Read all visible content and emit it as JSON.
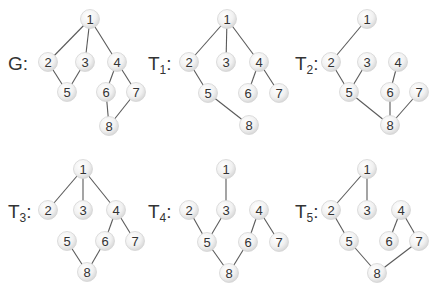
{
  "figure": {
    "width": 439,
    "height": 296,
    "node_radius": 9.5,
    "colors": {
      "edge": "#5a5a5a",
      "node_fill_center": "#ffffff",
      "node_fill_edge": "#d9d9d9",
      "text": "#333333"
    },
    "graphs": [
      {
        "id": "G",
        "label": "G",
        "subscript": "",
        "label_pos": [
          8,
          70
        ],
        "nodes": [
          {
            "id": "1",
            "x": 90,
            "y": 19
          },
          {
            "id": "2",
            "x": 48,
            "y": 62
          },
          {
            "id": "3",
            "x": 85,
            "y": 62
          },
          {
            "id": "4",
            "x": 117,
            "y": 62
          },
          {
            "id": "5",
            "x": 67,
            "y": 92
          },
          {
            "id": "6",
            "x": 106,
            "y": 92
          },
          {
            "id": "7",
            "x": 136,
            "y": 92
          },
          {
            "id": "8",
            "x": 109,
            "y": 126
          }
        ],
        "edges": [
          [
            "1",
            "2"
          ],
          [
            "1",
            "3"
          ],
          [
            "1",
            "4"
          ],
          [
            "2",
            "5"
          ],
          [
            "3",
            "5"
          ],
          [
            "4",
            "6"
          ],
          [
            "4",
            "7"
          ],
          [
            "6",
            "8"
          ],
          [
            "7",
            "8"
          ]
        ]
      },
      {
        "id": "T1",
        "label": "T",
        "subscript": "1",
        "label_pos": [
          148,
          70
        ],
        "nodes": [
          {
            "id": "1",
            "x": 227,
            "y": 19
          },
          {
            "id": "2",
            "x": 189,
            "y": 62
          },
          {
            "id": "3",
            "x": 226,
            "y": 62
          },
          {
            "id": "4",
            "x": 259,
            "y": 62
          },
          {
            "id": "5",
            "x": 208,
            "y": 93
          },
          {
            "id": "6",
            "x": 248,
            "y": 93
          },
          {
            "id": "7",
            "x": 279,
            "y": 93
          },
          {
            "id": "8",
            "x": 249,
            "y": 125
          }
        ],
        "edges": [
          [
            "1",
            "2"
          ],
          [
            "1",
            "3"
          ],
          [
            "1",
            "4"
          ],
          [
            "2",
            "5"
          ],
          [
            "4",
            "6"
          ],
          [
            "4",
            "7"
          ],
          [
            "5",
            "8"
          ]
        ]
      },
      {
        "id": "T2",
        "label": "T",
        "subscript": "2",
        "label_pos": [
          295,
          70
        ],
        "nodes": [
          {
            "id": "1",
            "x": 367,
            "y": 19
          },
          {
            "id": "2",
            "x": 331,
            "y": 62
          },
          {
            "id": "3",
            "x": 367,
            "y": 62
          },
          {
            "id": "4",
            "x": 398,
            "y": 62
          },
          {
            "id": "5",
            "x": 349,
            "y": 92
          },
          {
            "id": "6",
            "x": 390,
            "y": 92
          },
          {
            "id": "7",
            "x": 419,
            "y": 92
          },
          {
            "id": "8",
            "x": 390,
            "y": 125
          }
        ],
        "edges": [
          [
            "1",
            "2"
          ],
          [
            "2",
            "5"
          ],
          [
            "3",
            "5"
          ],
          [
            "4",
            "6"
          ],
          [
            "5",
            "8"
          ],
          [
            "6",
            "8"
          ],
          [
            "7",
            "8"
          ]
        ]
      },
      {
        "id": "T3",
        "label": "T",
        "subscript": "3",
        "label_pos": [
          8,
          218
        ],
        "nodes": [
          {
            "id": "1",
            "x": 83,
            "y": 169
          },
          {
            "id": "2",
            "x": 48,
            "y": 210
          },
          {
            "id": "3",
            "x": 83,
            "y": 210
          },
          {
            "id": "4",
            "x": 116,
            "y": 210
          },
          {
            "id": "5",
            "x": 67,
            "y": 241
          },
          {
            "id": "6",
            "x": 105,
            "y": 241
          },
          {
            "id": "7",
            "x": 135,
            "y": 241
          },
          {
            "id": "8",
            "x": 87,
            "y": 272
          }
        ],
        "edges": [
          [
            "1",
            "2"
          ],
          [
            "1",
            "3"
          ],
          [
            "1",
            "4"
          ],
          [
            "4",
            "6"
          ],
          [
            "4",
            "7"
          ],
          [
            "5",
            "8"
          ],
          [
            "6",
            "8"
          ]
        ]
      },
      {
        "id": "T4",
        "label": "T",
        "subscript": "4",
        "label_pos": [
          148,
          218
        ],
        "nodes": [
          {
            "id": "1",
            "x": 226,
            "y": 169
          },
          {
            "id": "2",
            "x": 189,
            "y": 210
          },
          {
            "id": "3",
            "x": 226,
            "y": 210
          },
          {
            "id": "4",
            "x": 259,
            "y": 210
          },
          {
            "id": "5",
            "x": 207,
            "y": 242
          },
          {
            "id": "6",
            "x": 248,
            "y": 242
          },
          {
            "id": "7",
            "x": 279,
            "y": 242
          },
          {
            "id": "8",
            "x": 229,
            "y": 273
          }
        ],
        "edges": [
          [
            "1",
            "3"
          ],
          [
            "2",
            "5"
          ],
          [
            "3",
            "5"
          ],
          [
            "4",
            "6"
          ],
          [
            "4",
            "7"
          ],
          [
            "5",
            "8"
          ],
          [
            "6",
            "8"
          ]
        ]
      },
      {
        "id": "T5",
        "label": "T",
        "subscript": "5",
        "label_pos": [
          295,
          218
        ],
        "nodes": [
          {
            "id": "1",
            "x": 367,
            "y": 169
          },
          {
            "id": "2",
            "x": 331,
            "y": 210
          },
          {
            "id": "3",
            "x": 367,
            "y": 210
          },
          {
            "id": "4",
            "x": 401,
            "y": 210
          },
          {
            "id": "5",
            "x": 349,
            "y": 241
          },
          {
            "id": "6",
            "x": 389,
            "y": 241
          },
          {
            "id": "7",
            "x": 419,
            "y": 241
          },
          {
            "id": "8",
            "x": 377,
            "y": 273
          }
        ],
        "edges": [
          [
            "1",
            "2"
          ],
          [
            "1",
            "3"
          ],
          [
            "2",
            "5"
          ],
          [
            "4",
            "6"
          ],
          [
            "4",
            "7"
          ],
          [
            "5",
            "8"
          ],
          [
            "7",
            "8"
          ]
        ]
      }
    ]
  }
}
